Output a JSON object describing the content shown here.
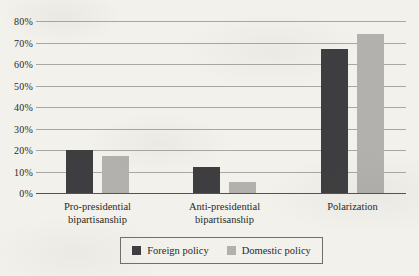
{
  "figure": {
    "background_color": "#f2f1ec",
    "text_color": "#2b2925",
    "gridline_color": "#8f8e88",
    "axis_line_color": "#55534d",
    "legend_border_color": "#716f6a"
  },
  "chart_data": {
    "type": "bar",
    "title": "",
    "xlabel": "",
    "ylabel": "",
    "categories": [
      {
        "label_lines": [
          "Pro-presidential",
          "bipartisanship"
        ]
      },
      {
        "label_lines": [
          "Anti-presidential",
          "bipartisanship"
        ]
      },
      {
        "label_lines": [
          "Polarization"
        ]
      }
    ],
    "series": [
      {
        "name": "Foreign policy",
        "color": "#3e3d3f",
        "values": [
          20,
          12,
          67
        ]
      },
      {
        "name": "Domestic policy",
        "color": "#b2b1ae",
        "values": [
          17,
          5,
          74
        ]
      }
    ],
    "ylim": [
      0,
      80
    ],
    "ytick_step": 10,
    "ytick_labels": [
      "0%",
      "10%",
      "20%",
      "30%",
      "40%",
      "50%",
      "60%",
      "70%",
      "80%"
    ],
    "grid": true,
    "legend_position": "bottom-boxed"
  }
}
